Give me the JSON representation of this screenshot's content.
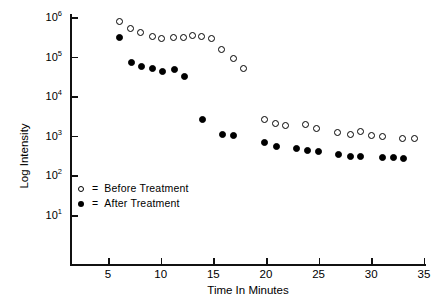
{
  "chart_data": {
    "type": "scatter",
    "title": "",
    "xlabel": "Time In Minutes",
    "ylabel": "Log Intensity",
    "xlim": [
      3,
      36
    ],
    "ylim": [
      1,
      6
    ],
    "yscale": "log",
    "grid": false,
    "legend_position": "lower-left-inside",
    "x_ticks": [
      5,
      10,
      15,
      20,
      25,
      30,
      35
    ],
    "x_tick_labels": [
      "5",
      "10",
      "15",
      "20",
      "25",
      "30",
      "35"
    ],
    "y_ticks": [
      1,
      2,
      3,
      4,
      5,
      6
    ],
    "y_tick_labels": [
      "10¹",
      "10²",
      "10³",
      "10⁴",
      "10⁵",
      "10⁶"
    ],
    "y_tick_bases": [
      "10",
      "10",
      "10",
      "10",
      "10",
      "10"
    ],
    "y_tick_exponents": [
      "1",
      "2",
      "3",
      "4",
      "5",
      "6"
    ],
    "series": [
      {
        "name": "Before Treatment",
        "marker": "open-circle",
        "color": "#000000",
        "points": [
          {
            "x": 6.1,
            "y": 5.88
          },
          {
            "x": 7.1,
            "y": 5.72
          },
          {
            "x": 8.1,
            "y": 5.62
          },
          {
            "x": 9.2,
            "y": 5.52
          },
          {
            "x": 10.1,
            "y": 5.45
          },
          {
            "x": 11.2,
            "y": 5.47
          },
          {
            "x": 12.2,
            "y": 5.47
          },
          {
            "x": 13.0,
            "y": 5.53
          },
          {
            "x": 13.9,
            "y": 5.52
          },
          {
            "x": 14.8,
            "y": 5.46
          },
          {
            "x": 15.8,
            "y": 5.18
          },
          {
            "x": 16.9,
            "y": 4.94
          },
          {
            "x": 17.9,
            "y": 4.7
          },
          {
            "x": 19.9,
            "y": 3.4
          },
          {
            "x": 20.9,
            "y": 3.3
          },
          {
            "x": 21.9,
            "y": 3.26
          },
          {
            "x": 23.8,
            "y": 3.28
          },
          {
            "x": 24.8,
            "y": 3.18
          },
          {
            "x": 26.8,
            "y": 3.08
          },
          {
            "x": 28.0,
            "y": 3.03
          },
          {
            "x": 29.0,
            "y": 3.1
          },
          {
            "x": 30.0,
            "y": 3.0
          },
          {
            "x": 31.1,
            "y": 2.98
          },
          {
            "x": 33.0,
            "y": 2.92
          },
          {
            "x": 34.1,
            "y": 2.92
          }
        ]
      },
      {
        "name": "After Treatment",
        "marker": "filled-circle",
        "color": "#000000",
        "points": [
          {
            "x": 6.1,
            "y": 5.48
          },
          {
            "x": 7.2,
            "y": 4.85
          },
          {
            "x": 8.2,
            "y": 4.76
          },
          {
            "x": 9.2,
            "y": 4.7
          },
          {
            "x": 10.2,
            "y": 4.63
          },
          {
            "x": 11.3,
            "y": 4.68
          },
          {
            "x": 12.3,
            "y": 4.51
          },
          {
            "x": 14.0,
            "y": 3.42
          },
          {
            "x": 15.9,
            "y": 3.04
          },
          {
            "x": 16.9,
            "y": 3.02
          },
          {
            "x": 19.9,
            "y": 2.82
          },
          {
            "x": 21.0,
            "y": 2.74
          },
          {
            "x": 22.9,
            "y": 2.68
          },
          {
            "x": 23.9,
            "y": 2.64
          },
          {
            "x": 25.0,
            "y": 2.6
          },
          {
            "x": 26.9,
            "y": 2.52
          },
          {
            "x": 28.0,
            "y": 2.48
          },
          {
            "x": 29.0,
            "y": 2.47
          },
          {
            "x": 31.1,
            "y": 2.45
          },
          {
            "x": 32.1,
            "y": 2.44
          },
          {
            "x": 33.1,
            "y": 2.43
          }
        ]
      }
    ]
  },
  "legend": {
    "items": [
      {
        "marker": "open-circle",
        "equals": "=",
        "label": "Before Treatment"
      },
      {
        "marker": "filled-circle",
        "equals": "=",
        "label": "After Treatment"
      }
    ]
  }
}
